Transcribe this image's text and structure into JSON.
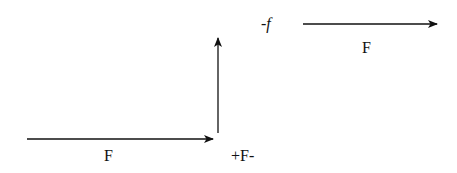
{
  "diagram": {
    "colors": {
      "stroke": "#111111",
      "background": "#ffffff"
    },
    "arrows": [
      {
        "id": "bottom-horizontal",
        "direction": "right",
        "x1": 27,
        "y1": 139,
        "x2": 213,
        "y2": 139
      },
      {
        "id": "vertical",
        "direction": "up",
        "x1": 218,
        "y1": 133,
        "x2": 218,
        "y2": 38
      },
      {
        "id": "top-horizontal",
        "direction": "right",
        "x1": 303,
        "y1": 24,
        "x2": 437,
        "y2": 24
      }
    ],
    "labels": {
      "bottom_force": "F",
      "corner_label": "+F-",
      "friction_label": "-f",
      "top_force": "F"
    }
  }
}
